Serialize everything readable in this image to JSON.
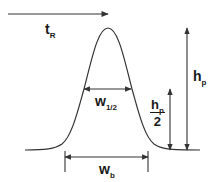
{
  "diagram": {
    "type": "chromatographic-peak",
    "colors": {
      "line": "#333333",
      "text": "#1a1a1a",
      "background": "#ffffff"
    },
    "labels": {
      "retention_time": {
        "main": "t",
        "sub": "R"
      },
      "half_width": {
        "main": "w",
        "sub": "1/2"
      },
      "base_width": {
        "main": "w",
        "sub": "b"
      },
      "peak_height": {
        "main": "h",
        "sub": "p"
      },
      "half_height": {
        "num_main": "h",
        "num_sub": "p",
        "den": "2"
      }
    }
  }
}
